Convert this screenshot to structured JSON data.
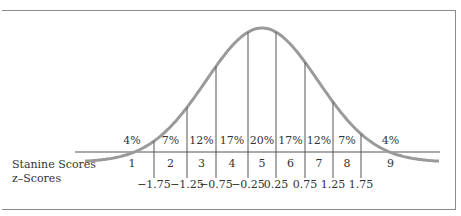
{
  "caption_fragment": "",
  "chart_data": {
    "type": "area",
    "categories": [
      "1",
      "2",
      "3",
      "4",
      "5",
      "6",
      "7",
      "8",
      "9"
    ],
    "percent_labels": [
      "4%",
      "7%",
      "12%",
      "17%",
      "20%",
      "17%",
      "12%",
      "7%",
      "4%"
    ],
    "values": [
      4,
      7,
      12,
      17,
      20,
      17,
      12,
      7,
      4
    ],
    "z_boundaries": [
      -1.75,
      -1.25,
      -0.75,
      -0.25,
      0.25,
      0.75,
      1.25,
      1.75
    ],
    "z_labels": [
      "-1.75",
      "-1.25",
      "-0.75",
      "-0.25",
      "0.25",
      "0.75",
      "1.25",
      "1.75"
    ],
    "row_labels": {
      "stanine": "Stanine Scores",
      "z": "z-Scores"
    },
    "grid": false,
    "legend": "none"
  },
  "labels": {
    "stanine_row": "Stanine Scores",
    "z_row": "z–Scores"
  }
}
